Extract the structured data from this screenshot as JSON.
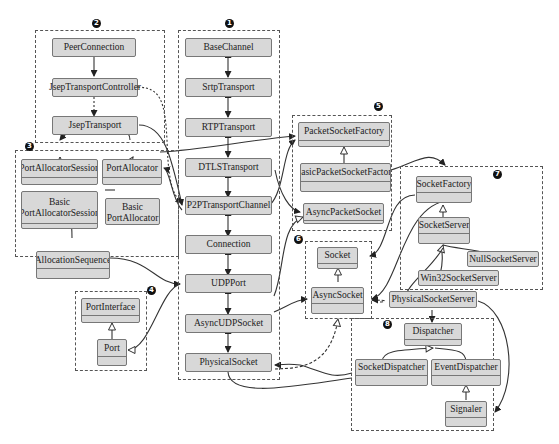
{
  "groups": {
    "g1": {
      "badge": "1"
    },
    "g2": {
      "badge": "2"
    },
    "g3": {
      "badge": "3"
    },
    "g4": {
      "badge": "4"
    },
    "g5": {
      "badge": "5"
    },
    "g6": {
      "badge": "6"
    },
    "g7": {
      "badge": "7"
    },
    "g8": {
      "badge": "8"
    }
  },
  "nodes": {
    "peer_connection": "PeerConnection",
    "jsep_transport_controller": "JsepTransportController",
    "jsep_transport": "JsepTransport",
    "base_channel": "BaseChannel",
    "srtp_transport": "SrtpTransport",
    "rtp_transport": "RTPTransport",
    "dtls_transport": "DTLSTransport",
    "p2p_transport_channel": "P2PTransportChannel",
    "connection": "Connection",
    "udp_port": "UDPPort",
    "async_udp_socket": "AsyncUDPSocket",
    "physical_socket": "PhysicalSocket",
    "port_allocator_session": "PortAllocatorSession",
    "port_allocator": "PortAllocator",
    "basic_port_allocator_session_l1": "Basic",
    "basic_port_allocator_session_l2": "PortAllocatorSession",
    "basic_port_allocator_l1": "Basic",
    "basic_port_allocator_l2": "PortAllocator",
    "allocation_sequence": "AllocationSequence",
    "port_interface": "PortInterface",
    "port": "Port",
    "packet_socket_factory": "PacketSocketFactory",
    "basic_packet_socket_factory": "BasicPacketSocketFactory",
    "async_packet_socket": "AsyncPacketSocket",
    "socket": "Socket",
    "async_socket": "AsyncSocket",
    "socket_factory": "SocketFactory",
    "socket_server": "SocketServer",
    "null_socket_server": "NullSocketServer",
    "win32_socket_server": "Win32SocketServer",
    "physical_socket_server": "PhysicalSocketServer",
    "dispatcher": "Dispatcher",
    "socket_dispatcher": "SocketDispatcher",
    "event_dispatcher": "EventDispatcher",
    "signaler": "Signaler"
  },
  "colors": {
    "box_fill": "#d8d8d8",
    "box_border": "#777777",
    "line": "#333333",
    "background": "#ffffff"
  }
}
